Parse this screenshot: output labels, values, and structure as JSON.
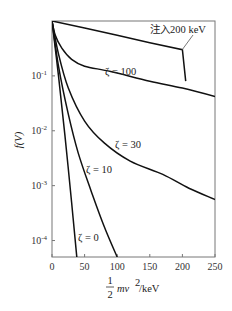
{
  "chart_data": {
    "type": "line",
    "title": "",
    "xlabel": "1/2 mv²/keV",
    "xlabel_parts": {
      "frac_num": "1",
      "frac_den": "2",
      "rest": "mv",
      "sup": "2",
      "unit": "/keV"
    },
    "ylabel": "f(V)",
    "xlim": [
      0,
      250
    ],
    "ylim_log10": [
      -4.3,
      0
    ],
    "yscale": "log",
    "grid": false,
    "x_ticks": [
      0,
      50,
      100,
      150,
      200,
      250
    ],
    "x_tick_labels": [
      "0",
      "50",
      "100",
      "150",
      "200",
      "250"
    ],
    "y_ticks_log10": [
      -1,
      -2,
      -3,
      -4
    ],
    "y_tick_labels": [
      {
        "base": "10",
        "exp": "-1"
      },
      {
        "base": "10",
        "exp": "-2"
      },
      {
        "base": "10",
        "exp": "-3"
      },
      {
        "base": "10",
        "exp": "-4"
      }
    ],
    "series": [
      {
        "name": "注入200 keV",
        "label": "注入200 keV",
        "x": [
          0,
          50,
          100,
          150,
          200,
          200,
          205
        ],
        "y": [
          1.0,
          0.75,
          0.55,
          0.4,
          0.3,
          0.3,
          0.08
        ]
      },
      {
        "name": "ζ=100",
        "label": "ζ = 100",
        "x": [
          0,
          5,
          15,
          30,
          50,
          90,
          150,
          200,
          250
        ],
        "y": [
          1.0,
          0.55,
          0.32,
          0.2,
          0.15,
          0.12,
          0.08,
          0.06,
          0.042
        ]
      },
      {
        "name": "ζ=30",
        "label": "ζ = 30",
        "x": [
          0,
          10,
          25,
          50,
          80,
          120,
          170,
          210,
          250
        ],
        "y": [
          1.0,
          0.25,
          0.06,
          0.015,
          0.006,
          0.0028,
          0.0016,
          0.0009,
          0.00056
        ]
      },
      {
        "name": "ζ=10",
        "label": "ζ = 10",
        "x": [
          0,
          10,
          25,
          40,
          60,
          80,
          100
        ],
        "y": [
          1.0,
          0.15,
          0.02,
          0.004,
          0.0008,
          0.00018,
          5e-05
        ]
      },
      {
        "name": "ζ=0",
        "label": "ζ = 0",
        "x": [
          0,
          10,
          20,
          30,
          38
        ],
        "y": [
          1.0,
          0.1,
          0.008,
          0.0005,
          5e-05
        ]
      }
    ],
    "annotations": [
      {
        "text": "注入200 keV",
        "points_to": [
          200,
          0.3
        ]
      },
      {
        "text": "ζ = 100"
      },
      {
        "text": "ζ = 30"
      },
      {
        "text": "ζ = 10"
      },
      {
        "text": "ζ = 0"
      }
    ]
  },
  "labels": {
    "inject": "注入200 keV",
    "z100": "ζ = 100",
    "z30": "ζ = 30",
    "z10": "ζ = 10",
    "z0": "ζ = 0",
    "ylabel": "f(V)",
    "xlabel_num": "1",
    "xlabel_den": "2",
    "xlabel_rest": "mv",
    "xlabel_sup": "2",
    "xlabel_unit": "/keV"
  }
}
